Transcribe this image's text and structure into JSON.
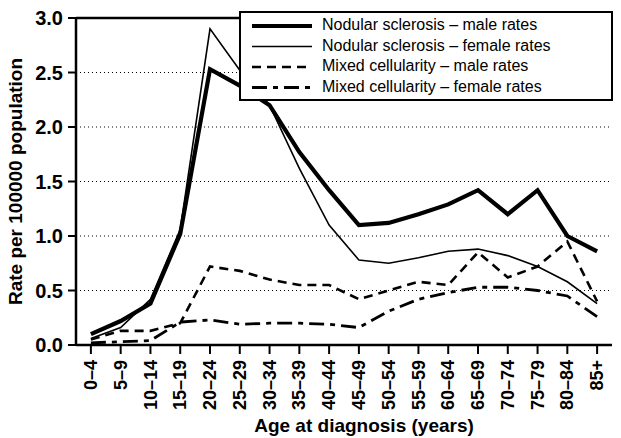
{
  "chart_data": {
    "type": "line",
    "title": "",
    "xlabel": "Age at diagnosis (years)",
    "ylabel": "Rate per 100000 population",
    "categories": [
      "0–4",
      "5–9",
      "10–14",
      "15–19",
      "20–24",
      "25–29",
      "30–34",
      "35–39",
      "40–44",
      "45–49",
      "50–54",
      "55–59",
      "60–64",
      "65–69",
      "70–74",
      "75–79",
      "80–84",
      "85+"
    ],
    "ylim": [
      0,
      3.0
    ],
    "yticks": [
      "0.0",
      "0.5",
      "1.0",
      "1.5",
      "2.0",
      "2.5",
      "3.0"
    ],
    "ytick_values": [
      0.0,
      0.5,
      1.0,
      1.5,
      2.0,
      2.5,
      3.0
    ],
    "grid": true,
    "grid_axis": "y",
    "legend_position": "top-right",
    "series": [
      {
        "name": "Nodular sclerosis – male rates",
        "style": "solid-thick",
        "values": [
          0.1,
          0.22,
          0.38,
          1.02,
          2.53,
          2.38,
          2.2,
          1.77,
          1.42,
          1.1,
          1.12,
          1.2,
          1.29,
          1.42,
          1.2,
          1.42,
          1.0,
          0.86
        ]
      },
      {
        "name": "Nodular sclerosis – female rates",
        "style": "solid-thin",
        "values": [
          0.06,
          0.16,
          0.42,
          1.06,
          2.9,
          2.52,
          2.2,
          1.62,
          1.1,
          0.78,
          0.75,
          0.8,
          0.86,
          0.88,
          0.82,
          0.72,
          0.58,
          0.38
        ]
      },
      {
        "name": "Mixed cellularity – male rates",
        "style": "dashed",
        "values": [
          0.05,
          0.13,
          0.13,
          0.2,
          0.72,
          0.68,
          0.6,
          0.55,
          0.55,
          0.42,
          0.5,
          0.58,
          0.55,
          0.85,
          0.62,
          0.72,
          0.95,
          0.4
        ]
      },
      {
        "name": "Mixed cellularity – female rates",
        "style": "dash-dot",
        "values": [
          0.02,
          0.03,
          0.04,
          0.21,
          0.23,
          0.19,
          0.2,
          0.2,
          0.19,
          0.16,
          0.31,
          0.42,
          0.48,
          0.53,
          0.53,
          0.5,
          0.45,
          0.26
        ]
      }
    ]
  },
  "colors": {
    "ink": "#000000",
    "background": "#ffffff"
  }
}
